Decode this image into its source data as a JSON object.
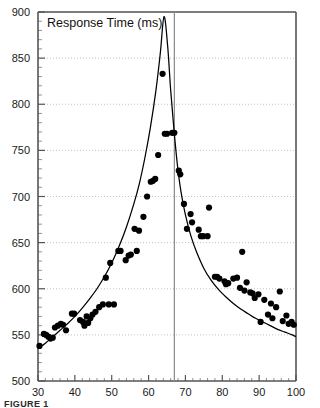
{
  "figure": {
    "caption": "FIGURE 1",
    "title": "Response Time (ms)"
  },
  "chart_data": {
    "type": "scatter",
    "title": "Response Time (ms)",
    "xlabel": "",
    "ylabel": "Response Time (ms)",
    "xlim": [
      30,
      100
    ],
    "ylim": [
      500,
      900
    ],
    "xticks": [
      30,
      40,
      50,
      60,
      70,
      80,
      90,
      100
    ],
    "yticks": [
      500,
      550,
      600,
      650,
      700,
      750,
      800,
      850,
      900
    ],
    "grid": "horizontal-dotted",
    "legend": "none",
    "minor_ticks": true,
    "annotations": [
      {
        "type": "vertical-line",
        "x": 67,
        "label": ""
      }
    ],
    "series": [
      {
        "name": "observations",
        "type": "scatter",
        "marker": "filled-circle",
        "color": "#000000",
        "points": [
          [
            30.4,
            538
          ],
          [
            31.6,
            551
          ],
          [
            32.2,
            550
          ],
          [
            32.8,
            548
          ],
          [
            33.4,
            546
          ],
          [
            34.0,
            547
          ],
          [
            34.6,
            558
          ],
          [
            35.4,
            560
          ],
          [
            36.2,
            562
          ],
          [
            36.8,
            561
          ],
          [
            37.6,
            555
          ],
          [
            39.2,
            573
          ],
          [
            39.8,
            573
          ],
          [
            41.4,
            566
          ],
          [
            42.2,
            564
          ],
          [
            42.6,
            560
          ],
          [
            43.2,
            570
          ],
          [
            43.6,
            563
          ],
          [
            44.2,
            568
          ],
          [
            44.8,
            572
          ],
          [
            45.6,
            575
          ],
          [
            46.6,
            580
          ],
          [
            47.6,
            583
          ],
          [
            48.4,
            612
          ],
          [
            49.2,
            583
          ],
          [
            50.6,
            583
          ],
          [
            49.6,
            628
          ],
          [
            51.8,
            641
          ],
          [
            52.4,
            641
          ],
          [
            53.8,
            631
          ],
          [
            54.6,
            636
          ],
          [
            55.2,
            637
          ],
          [
            56.2,
            665
          ],
          [
            56.8,
            641
          ],
          [
            57.4,
            663
          ],
          [
            58.6,
            678
          ],
          [
            59.6,
            700
          ],
          [
            60.6,
            716
          ],
          [
            61.2,
            717
          ],
          [
            61.8,
            719
          ],
          [
            62.6,
            745
          ],
          [
            63.8,
            833
          ],
          [
            64.4,
            768
          ],
          [
            65.0,
            768
          ],
          [
            66.4,
            769
          ],
          [
            67.0,
            769
          ],
          [
            68.2,
            728
          ],
          [
            68.6,
            724
          ],
          [
            69.6,
            692
          ],
          [
            70.4,
            665
          ],
          [
            71.4,
            681
          ],
          [
            71.8,
            672
          ],
          [
            73.6,
            664
          ],
          [
            74.2,
            657
          ],
          [
            74.8,
            657
          ],
          [
            76.0,
            657
          ],
          [
            76.4,
            688
          ],
          [
            78.0,
            613
          ],
          [
            78.6,
            613
          ],
          [
            79.2,
            611
          ],
          [
            80.6,
            608
          ],
          [
            81.0,
            605
          ],
          [
            81.6,
            606
          ],
          [
            83.0,
            611
          ],
          [
            84.0,
            612
          ],
          [
            84.8,
            601
          ],
          [
            85.4,
            640
          ],
          [
            86.0,
            598
          ],
          [
            86.6,
            607
          ],
          [
            87.6,
            596
          ],
          [
            88.2,
            595
          ],
          [
            88.8,
            590
          ],
          [
            89.8,
            594
          ],
          [
            90.4,
            564
          ],
          [
            91.4,
            588
          ],
          [
            92.4,
            572
          ],
          [
            93.2,
            584
          ],
          [
            93.6,
            568
          ],
          [
            94.6,
            580
          ],
          [
            95.6,
            597
          ],
          [
            96.4,
            565
          ],
          [
            97.4,
            571
          ],
          [
            98.0,
            562
          ],
          [
            98.8,
            564
          ],
          [
            99.4,
            561
          ]
        ]
      },
      {
        "name": "fitted-curve",
        "type": "line",
        "color": "#000000",
        "points": [
          [
            30.0,
            535
          ],
          [
            32.0,
            541
          ],
          [
            34.0,
            548
          ],
          [
            36.0,
            555
          ],
          [
            38.0,
            562
          ],
          [
            40.0,
            570
          ],
          [
            42.0,
            579
          ],
          [
            44.0,
            589
          ],
          [
            46.0,
            600
          ],
          [
            48.0,
            613
          ],
          [
            50.0,
            628
          ],
          [
            52.0,
            646
          ],
          [
            54.0,
            667
          ],
          [
            56.0,
            692
          ],
          [
            57.5,
            714
          ],
          [
            59.0,
            742
          ],
          [
            60.5,
            775
          ],
          [
            62.0,
            815
          ],
          [
            63.2,
            856
          ],
          [
            64.2,
            895
          ],
          [
            65.2,
            862
          ],
          [
            66.0,
            815
          ],
          [
            66.9,
            772
          ],
          [
            67.8,
            735
          ],
          [
            68.8,
            705
          ],
          [
            70.0,
            680
          ],
          [
            71.5,
            657
          ],
          [
            73.0,
            640
          ],
          [
            75.0,
            622
          ],
          [
            77.0,
            609
          ],
          [
            79.0,
            599
          ],
          [
            81.0,
            591
          ],
          [
            83.0,
            584
          ],
          [
            85.0,
            578
          ],
          [
            87.0,
            573
          ],
          [
            89.0,
            568
          ],
          [
            91.0,
            564
          ],
          [
            93.0,
            560
          ],
          [
            95.0,
            556
          ],
          [
            97.0,
            553
          ],
          [
            99.0,
            550
          ],
          [
            100.0,
            548
          ]
        ]
      }
    ]
  }
}
